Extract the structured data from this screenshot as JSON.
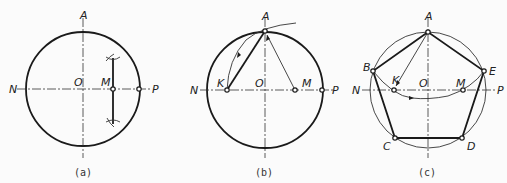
{
  "panels": [
    {
      "caption": "(a)",
      "labels": {
        "A": "A",
        "N": "N",
        "O": "O",
        "M": "M",
        "P": "P"
      },
      "step": "Bisect OP to locate midpoint M"
    },
    {
      "caption": "(b)",
      "labels": {
        "A": "A",
        "N": "N",
        "O": "O",
        "K": "K",
        "M": "M",
        "P": "P"
      },
      "step": "With center M and radius MA, draw arc to cut ON at K"
    },
    {
      "caption": "(c)",
      "labels": {
        "A": "A",
        "B": "B",
        "C": "C",
        "D": "D",
        "E": "E",
        "N": "N",
        "O": "O",
        "K": "K",
        "M": "M",
        "P": "P"
      },
      "step": "AK is the side length; step around the circle to get B, C, D, E"
    }
  ],
  "colors": {
    "line": "#1a1a1a",
    "background": "#fbfbfb"
  }
}
